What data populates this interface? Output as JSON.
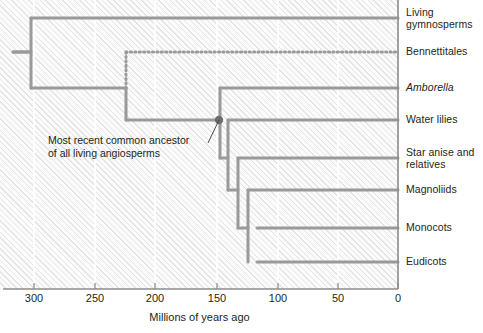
{
  "figure": {
    "type": "phylogenetic-tree-cladogram",
    "width": 483,
    "height": 333
  },
  "colors": {
    "branch": "#9a9a9a",
    "node": "#6e6e6e",
    "text": "#231f20",
    "axis": "#8c8c8c",
    "background": "#fbfbfb",
    "hatch": "#afafaf"
  },
  "axis": {
    "title": "Millions of years ago",
    "direction": "reversed",
    "unit": "Ma",
    "min": 0,
    "max": 330,
    "ticks": [
      {
        "value": 300,
        "label": "300",
        "x": 34
      },
      {
        "value": 250,
        "label": "250",
        "x": 95
      },
      {
        "value": 200,
        "label": "200",
        "x": 155
      },
      {
        "value": 150,
        "label": "150",
        "x": 217
      },
      {
        "value": 100,
        "label": "100",
        "x": 278
      },
      {
        "value": 50,
        "label": "50",
        "x": 338
      },
      {
        "value": 0,
        "label": "0",
        "x": 398
      }
    ]
  },
  "annotation": {
    "label": "Most recent common ancestor\nof all living angiosperms",
    "points_to": "mrca-node",
    "leader_from": {
      "x": 208,
      "y": 143
    },
    "leader_to": {
      "x": 219,
      "y": 120
    }
  },
  "mrca_node": {
    "name": "Most recent common ancestor of all living angiosperms",
    "age": 150,
    "x": 219,
    "y": 120,
    "radius": 4.2
  },
  "tips": [
    {
      "id": "living-gymnosperms",
      "label": "Living\ngymnosperms",
      "y": 18,
      "label_top": 7,
      "style": "solid",
      "italic": false
    },
    {
      "id": "bennettitales",
      "label": "Bennettitales",
      "y": 52,
      "label_top": 46,
      "style": "dotted",
      "italic": false,
      "note": "extinct"
    },
    {
      "id": "amborella",
      "label": "Amborella",
      "y": 88,
      "label_top": 82,
      "style": "solid",
      "italic": true
    },
    {
      "id": "water-lilies",
      "label": "Water lilies",
      "y": 120,
      "label_top": 114,
      "style": "solid",
      "italic": false
    },
    {
      "id": "star-anise",
      "label": "Star anise and\nrelatives",
      "y": 158,
      "label_top": 147,
      "style": "solid",
      "italic": false
    },
    {
      "id": "magnoliids",
      "label": "Magnoliids",
      "y": 190,
      "label_top": 184,
      "style": "solid",
      "italic": false
    },
    {
      "id": "monocots",
      "label": "Monocots",
      "y": 228,
      "label_top": 222,
      "style": "solid",
      "italic": false
    },
    {
      "id": "eudicots",
      "label": "Eudicots",
      "y": 262,
      "label_top": 256,
      "style": "solid",
      "italic": false
    }
  ],
  "internal_nodes": [
    {
      "id": "root",
      "x": 31,
      "y_top": 18,
      "y_bottom": 88,
      "age": 315,
      "stub_from_x": 13,
      "stub_y": 52
    },
    {
      "id": "seed-plant-split",
      "x": 126,
      "y_top": 52,
      "y_bottom": 120,
      "age": 237,
      "dotted_top": true
    },
    {
      "id": "angiosperm-mrca",
      "x": 220,
      "y_top": 88,
      "y_bottom": 158,
      "age": 150
    },
    {
      "id": "post-amborella",
      "x": 228,
      "y_top": 120,
      "y_bottom": 190,
      "age": 146
    },
    {
      "id": "mesangiosperms",
      "x": 238,
      "y_top": 158,
      "y_bottom": 228,
      "age": 141
    },
    {
      "id": "monocot-eudicot",
      "x": 248,
      "y_top": 190,
      "y_bottom": 262,
      "age": 136
    }
  ],
  "branches": [
    {
      "id": "branch-living-gymnosperms",
      "x1": 31,
      "x2": 398,
      "y": 18,
      "style": "solid"
    },
    {
      "id": "branch-bennettitales",
      "x1": 126,
      "x2": 398,
      "y": 52,
      "style": "dotted"
    },
    {
      "id": "branch-amborella",
      "x1": 220,
      "x2": 398,
      "y": 88,
      "style": "solid"
    },
    {
      "id": "branch-water-lilies",
      "x1": 228,
      "x2": 398,
      "y": 120,
      "style": "solid"
    },
    {
      "id": "branch-star-anise",
      "x1": 238,
      "x2": 398,
      "y": 158,
      "style": "solid"
    },
    {
      "id": "branch-magnoliids",
      "x1": 248,
      "x2": 398,
      "y": 190,
      "style": "solid"
    },
    {
      "id": "branch-monocots",
      "x1": 257,
      "x2": 398,
      "y": 228,
      "style": "solid"
    },
    {
      "id": "branch-eudicots",
      "x1": 257,
      "x2": 398,
      "y": 262,
      "style": "solid"
    },
    {
      "id": "branch-root-to-seedsplit",
      "x1": 31,
      "x2": 126,
      "y": 88,
      "style": "solid"
    },
    {
      "id": "branch-seedsplit-to-mrca",
      "x1": 126,
      "x2": 220,
      "y": 120,
      "style": "solid"
    },
    {
      "id": "branch-mrca-stub",
      "x1": 220,
      "x2": 228,
      "y": 158,
      "style": "solid"
    },
    {
      "id": "branch-meso-stub",
      "x1": 228,
      "x2": 238,
      "y": 190,
      "style": "solid"
    },
    {
      "id": "branch-monoeu-stub",
      "x1": 238,
      "x2": 248,
      "y": 228,
      "style": "solid"
    },
    {
      "id": "branch-root-stub",
      "x1": 13,
      "x2": 31,
      "y": 52,
      "style": "solid"
    }
  ],
  "gridlines_x": [
    34,
    95,
    155,
    217,
    278,
    338
  ]
}
